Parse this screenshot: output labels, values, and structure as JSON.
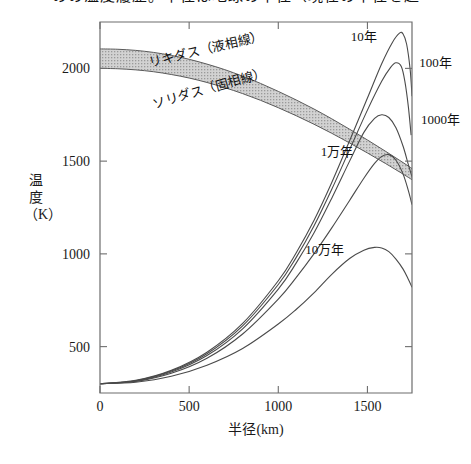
{
  "page": {
    "truncated_header_text": "のの温度履歴。半径は地球の半径（現在の半径を超"
  },
  "chart_data": {
    "type": "line",
    "title": "",
    "xlabel": "半径(km)",
    "ylabel": "温度（K）",
    "xlim": [
      0,
      1750
    ],
    "ylim": [
      250,
      2250
    ],
    "xticks": [
      0,
      500,
      1000,
      1500
    ],
    "xticklabels": [
      "0",
      "500",
      "1000",
      "1500"
    ],
    "yticks": [
      500,
      1000,
      1500,
      2000
    ],
    "yticklabels": [
      "500",
      "1000",
      "1500",
      "2000"
    ],
    "grid": false,
    "legend_position": "inline-annotations",
    "annotations": [
      {
        "name": "liquidus-label",
        "text": "リキダス（液相線）",
        "x": 600,
        "y": 2080
      },
      {
        "name": "solidus-label",
        "text": "ソリダス（固相線）",
        "x": 620,
        "y": 1870
      },
      {
        "name": "curve-label-10y",
        "text": "10年",
        "x": 1480,
        "y": 2150
      },
      {
        "name": "curve-label-100y",
        "text": "100年",
        "x": 1790,
        "y": 2010
      },
      {
        "name": "curve-label-1000y",
        "text": "1000年",
        "x": 1800,
        "y": 1700
      },
      {
        "name": "curve-label-10000y",
        "text": "1万年",
        "x": 1330,
        "y": 1530
      },
      {
        "name": "curve-label-100000y",
        "text": "10万年",
        "x": 1260,
        "y": 1000
      }
    ],
    "bands": [
      {
        "name": "melting-band",
        "label_upper": "リキダス（液相線）",
        "label_lower": "ソリダス（固相線）",
        "fill": "#c8c8c8",
        "upper": [
          [
            0,
            2105
          ],
          [
            100,
            2103
          ],
          [
            200,
            2097
          ],
          [
            300,
            2086
          ],
          [
            400,
            2070
          ],
          [
            500,
            2049
          ],
          [
            600,
            2023
          ],
          [
            700,
            1993
          ],
          [
            800,
            1958
          ],
          [
            900,
            1919
          ],
          [
            1000,
            1876
          ],
          [
            1100,
            1830
          ],
          [
            1200,
            1781
          ],
          [
            1300,
            1728
          ],
          [
            1400,
            1672
          ],
          [
            1500,
            1614
          ],
          [
            1600,
            1554
          ],
          [
            1700,
            1492
          ],
          [
            1750,
            1460
          ]
        ],
        "lower": [
          [
            0,
            2000
          ],
          [
            100,
            1998
          ],
          [
            200,
            1992
          ],
          [
            300,
            1982
          ],
          [
            400,
            1967
          ],
          [
            500,
            1948
          ],
          [
            600,
            1924
          ],
          [
            700,
            1896
          ],
          [
            800,
            1864
          ],
          [
            900,
            1828
          ],
          [
            1000,
            1788
          ],
          [
            1100,
            1745
          ],
          [
            1200,
            1699
          ],
          [
            1300,
            1650
          ],
          [
            1400,
            1598
          ],
          [
            1500,
            1544
          ],
          [
            1600,
            1488
          ],
          [
            1700,
            1430
          ],
          [
            1750,
            1400
          ]
        ]
      }
    ],
    "series": [
      {
        "name": "10年",
        "label": "10年",
        "values": [
          [
            0,
            300
          ],
          [
            200,
            318
          ],
          [
            400,
            372
          ],
          [
            600,
            470
          ],
          [
            800,
            625
          ],
          [
            1000,
            855
          ],
          [
            1100,
            1005
          ],
          [
            1200,
            1180
          ],
          [
            1300,
            1385
          ],
          [
            1400,
            1610
          ],
          [
            1500,
            1840
          ],
          [
            1580,
            2025
          ],
          [
            1640,
            2140
          ],
          [
            1680,
            2190
          ],
          [
            1700,
            2185
          ],
          [
            1720,
            2130
          ],
          [
            1740,
            1990
          ],
          [
            1750,
            1850
          ]
        ]
      },
      {
        "name": "100年",
        "label": "100年",
        "values": [
          [
            0,
            300
          ],
          [
            200,
            316
          ],
          [
            400,
            368
          ],
          [
            600,
            462
          ],
          [
            800,
            612
          ],
          [
            1000,
            835
          ],
          [
            1100,
            980
          ],
          [
            1200,
            1150
          ],
          [
            1300,
            1348
          ],
          [
            1400,
            1562
          ],
          [
            1500,
            1775
          ],
          [
            1580,
            1930
          ],
          [
            1630,
            2005
          ],
          [
            1660,
            2030
          ],
          [
            1690,
            2010
          ],
          [
            1710,
            1930
          ],
          [
            1730,
            1790
          ],
          [
            1745,
            1640
          ]
        ]
      },
      {
        "name": "1000年",
        "label": "1000年",
        "values": [
          [
            0,
            300
          ],
          [
            200,
            314
          ],
          [
            400,
            363
          ],
          [
            600,
            452
          ],
          [
            800,
            596
          ],
          [
            1000,
            810
          ],
          [
            1100,
            950
          ],
          [
            1200,
            1112
          ],
          [
            1300,
            1300
          ],
          [
            1400,
            1500
          ],
          [
            1480,
            1655
          ],
          [
            1540,
            1730
          ],
          [
            1580,
            1750
          ],
          [
            1620,
            1735
          ],
          [
            1660,
            1680
          ],
          [
            1700,
            1580
          ],
          [
            1730,
            1480
          ],
          [
            1750,
            1415
          ]
        ]
      },
      {
        "name": "1万年",
        "label": "1万年",
        "values": [
          [
            0,
            300
          ],
          [
            200,
            312
          ],
          [
            400,
            356
          ],
          [
            600,
            437
          ],
          [
            800,
            568
          ],
          [
            1000,
            756
          ],
          [
            1100,
            872
          ],
          [
            1200,
            1000
          ],
          [
            1300,
            1140
          ],
          [
            1400,
            1288
          ],
          [
            1480,
            1408
          ],
          [
            1540,
            1488
          ],
          [
            1580,
            1525
          ],
          [
            1620,
            1535
          ],
          [
            1660,
            1505
          ],
          [
            1700,
            1430
          ],
          [
            1730,
            1340
          ],
          [
            1750,
            1265
          ]
        ]
      },
      {
        "name": "10万年",
        "label": "10万年",
        "values": [
          [
            0,
            300
          ],
          [
            200,
            308
          ],
          [
            400,
            340
          ],
          [
            600,
            400
          ],
          [
            800,
            490
          ],
          [
            1000,
            622
          ],
          [
            1100,
            700
          ],
          [
            1200,
            790
          ],
          [
            1300,
            890
          ],
          [
            1400,
            975
          ],
          [
            1480,
            1020
          ],
          [
            1540,
            1035
          ],
          [
            1580,
            1032
          ],
          [
            1620,
            1012
          ],
          [
            1660,
            972
          ],
          [
            1700,
            918
          ],
          [
            1730,
            862
          ],
          [
            1750,
            820
          ]
        ]
      }
    ]
  }
}
